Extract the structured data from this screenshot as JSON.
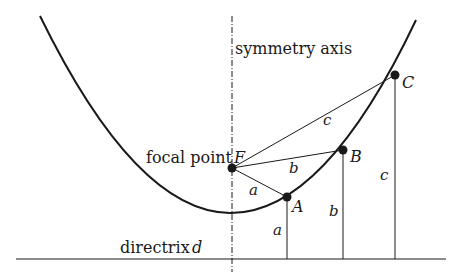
{
  "diagram": {
    "labels": {
      "symmetry_axis": "symmetry axis",
      "focal_point": "focal point",
      "focus": "F",
      "directrix": "directrix",
      "directrix_name": "d",
      "point_a": "A",
      "point_b": "B",
      "point_c": "C",
      "seg_a_focal": "a",
      "seg_b_focal": "b",
      "seg_c_focal": "c",
      "seg_a_directrix": "a",
      "seg_b_directrix": "b",
      "seg_c_directrix": "c"
    },
    "colors": {
      "stroke": "#1a1a1a",
      "background": "#ffffff"
    }
  }
}
